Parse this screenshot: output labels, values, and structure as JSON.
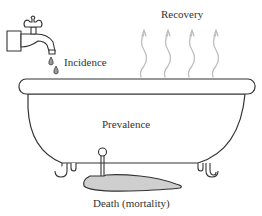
{
  "diagram": {
    "labels": {
      "incidence": "Incidence",
      "recovery": "Recovery",
      "prevalence": "Prevalence",
      "death": "Death (mortality)"
    },
    "components": {
      "inflow": "faucet",
      "outflow_evaporation": "steam",
      "outflow_drain": "drain",
      "stock": "bathtub"
    },
    "colors": {
      "stroke": "#333333",
      "steam": "#bdbdbd",
      "puddle_fill": "#cfcfcf",
      "background": "#ffffff"
    },
    "steam_count": 4
  }
}
